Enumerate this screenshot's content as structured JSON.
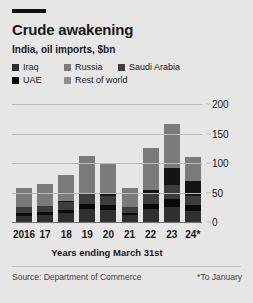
{
  "header": {
    "rule_label": "top-rule",
    "title": "Crude awakening",
    "subtitle": "India, oil imports, $bn"
  },
  "footer": {
    "source": "Source: Department of Commerce",
    "note": "*To January"
  },
  "chart_data": {
    "type": "bar",
    "subtype": "stacked-bar",
    "title": "Crude awakening",
    "subtitle": "India, oil imports, $bn",
    "xlabel": "Years ending March 31st",
    "ylabel": "$bn",
    "ylim": [
      0,
      200
    ],
    "yticks": [
      0,
      50,
      100,
      150,
      200
    ],
    "ytick_labels": [
      "0",
      "50",
      "100",
      "150",
      "200"
    ],
    "grid": true,
    "legend_position": "top-left",
    "categories": [
      "2016",
      "17",
      "18",
      "19",
      "20",
      "21",
      "22",
      "23",
      "24*"
    ],
    "series": [
      {
        "name": "Iraq",
        "color": "#2f2f2f",
        "values": [
          11,
          12,
          15,
          22,
          21,
          12,
          22,
          26,
          19
        ]
      },
      {
        "name": "UAE",
        "color": "#0a0a0a",
        "values": [
          4,
          5,
          6,
          9,
          8,
          4,
          9,
          13,
          10
        ]
      },
      {
        "name": "Saudi Arabia",
        "color": "#3d3d3d",
        "values": [
          10,
          10,
          13,
          17,
          16,
          9,
          18,
          23,
          16
        ]
      },
      {
        "name": "Russia",
        "color": "#141414",
        "values": [
          1,
          1,
          1,
          2,
          2,
          1,
          5,
          30,
          25
        ]
      },
      {
        "name": "Rest of world",
        "color": "#7b7b7b",
        "values": [
          32,
          36,
          45,
          62,
          51,
          31,
          71,
          75,
          40
        ]
      }
    ],
    "totals": [
      58,
      64,
      80,
      112,
      98,
      57,
      125,
      167,
      110
    ],
    "annotations": [
      "*To January"
    ]
  },
  "legend": {
    "rows": [
      [
        {
          "label": "Iraq",
          "color": "#2f2f2f",
          "swatch_name": "legend-swatch-iraq"
        },
        {
          "label": "Russia",
          "color": "#7b7b7b",
          "swatch_name": "legend-swatch-russia"
        },
        {
          "label": "Saudi Arabia",
          "color": "#3d3d3d",
          "swatch_name": "legend-swatch-saudi-arabia"
        }
      ],
      [
        {
          "label": "UAE",
          "color": "#0a0a0a",
          "swatch_name": "legend-swatch-uae"
        },
        {
          "label": "Rest of world",
          "color": "#8f8f8f",
          "swatch_name": "legend-swatch-rest-of-world"
        }
      ]
    ]
  },
  "colors": {
    "background": "#e6e6e4",
    "text": "#16191c",
    "grid": "#b9b9b7",
    "axis": "#6f6f6d",
    "bar_light": "#7b7b7b",
    "bar_dark": "#1a1a1a"
  }
}
